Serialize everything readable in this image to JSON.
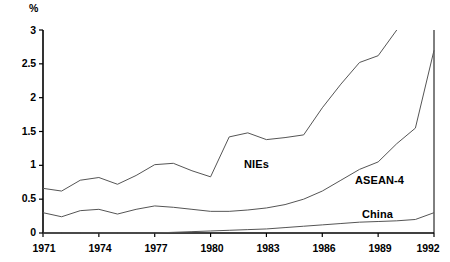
{
  "axis": {
    "unit_label": "%",
    "y_ticks": [
      "0",
      "0.5",
      "1",
      "1.5",
      "2",
      "2.5",
      "3"
    ],
    "x_ticks": [
      "1971",
      "1974",
      "1977",
      "1980",
      "1983",
      "1986",
      "1989",
      "1992"
    ]
  },
  "series_labels": {
    "nies": "NIEs",
    "asean4": "ASEAN-4",
    "china": "China"
  },
  "colors": {
    "line": "#555555",
    "axis": "#000000"
  },
  "chart_data": {
    "type": "line",
    "title": "",
    "subtitle": "",
    "xlabel": "",
    "ylabel": "%",
    "xlim": [
      1971,
      1992
    ],
    "ylim": [
      0,
      3
    ],
    "grid": false,
    "legend": "inline-labels",
    "x": [
      1971,
      1972,
      1973,
      1974,
      1975,
      1976,
      1977,
      1978,
      1979,
      1980,
      1981,
      1982,
      1983,
      1984,
      1985,
      1986,
      1987,
      1988,
      1989,
      1990,
      1991,
      1992
    ],
    "series": [
      {
        "name": "NIEs",
        "values": [
          0.66,
          0.62,
          0.78,
          0.82,
          0.72,
          0.85,
          1.01,
          1.03,
          0.92,
          0.83,
          1.42,
          1.48,
          1.38,
          1.41,
          1.45,
          1.85,
          2.2,
          2.52,
          2.62,
          3.0,
          null,
          null
        ]
      },
      {
        "name": "ASEAN-4",
        "values": [
          0.3,
          0.24,
          0.33,
          0.35,
          0.28,
          0.35,
          0.4,
          0.38,
          0.35,
          0.32,
          0.32,
          0.34,
          0.37,
          0.42,
          0.5,
          0.62,
          0.78,
          0.94,
          1.05,
          1.32,
          1.55,
          2.7
        ]
      },
      {
        "name": "China",
        "values": [
          0.0,
          0.0,
          0.0,
          0.0,
          0.0,
          0.0,
          0.0,
          0.01,
          0.02,
          0.03,
          0.04,
          0.05,
          0.06,
          0.08,
          0.1,
          0.12,
          0.14,
          0.16,
          0.17,
          0.18,
          0.2,
          0.3
        ]
      }
    ]
  }
}
